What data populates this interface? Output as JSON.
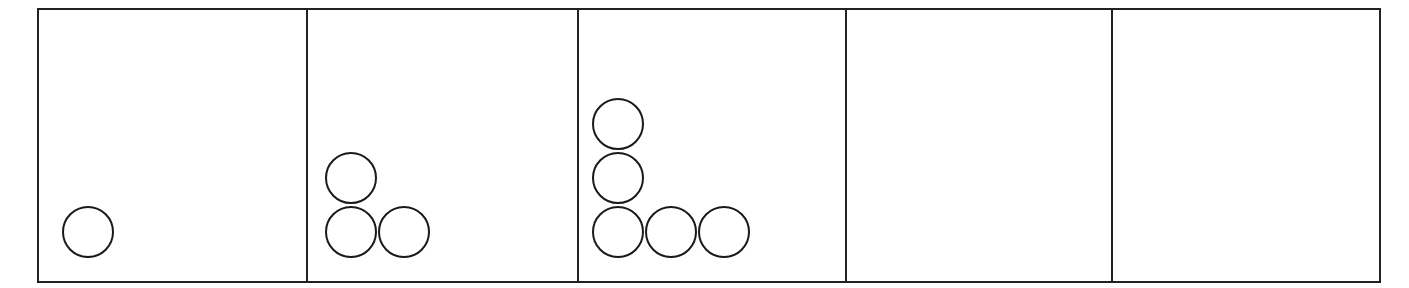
{
  "figure": {
    "stroke_color": "#222222",
    "panels": [
      {
        "index": 1,
        "circle_count": 1,
        "circles": [
          {
            "col": 0,
            "row": 0
          }
        ]
      },
      {
        "index": 2,
        "circle_count": 3,
        "circles": [
          {
            "col": 0,
            "row": 0
          },
          {
            "col": 1,
            "row": 0
          },
          {
            "col": 0,
            "row": 1
          }
        ]
      },
      {
        "index": 3,
        "circle_count": 5,
        "circles": [
          {
            "col": 0,
            "row": 0
          },
          {
            "col": 1,
            "row": 0
          },
          {
            "col": 2,
            "row": 0
          },
          {
            "col": 0,
            "row": 1
          },
          {
            "col": 0,
            "row": 2
          }
        ]
      },
      {
        "index": 4,
        "circle_count": 0,
        "circles": []
      },
      {
        "index": 5,
        "circle_count": 0,
        "circles": []
      }
    ]
  }
}
